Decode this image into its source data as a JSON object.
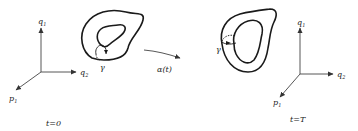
{
  "figure": {
    "left_panel": {
      "axes": {
        "vertical": {
          "symbol": "q",
          "subscript": "1"
        },
        "horizontal": {
          "symbol": "q",
          "subscript": "2"
        },
        "diagonal": {
          "symbol": "p",
          "subscript": "1"
        }
      },
      "loop_label": "γ",
      "time_label": "t=0"
    },
    "transition": {
      "map_label": "α(t)"
    },
    "right_panel": {
      "axes": {
        "vertical": {
          "symbol": "q",
          "subscript": "1"
        },
        "horizontal": {
          "symbol": "q",
          "subscript": "2"
        },
        "diagonal": {
          "symbol": "p",
          "subscript": "1"
        }
      },
      "loop_label": "γ",
      "time_label": "t=T"
    },
    "colors": {
      "ink": "#1a1a1a",
      "background": "#ffffff"
    }
  }
}
